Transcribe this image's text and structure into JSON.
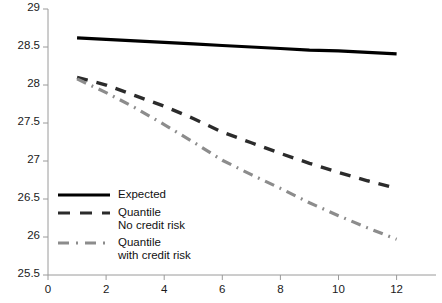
{
  "chart_data": {
    "type": "line",
    "title": "",
    "xlabel": "",
    "ylabel": "",
    "xlim": [
      0,
      12
    ],
    "ylim": [
      25.5,
      29
    ],
    "grid": false,
    "legend_position": "lower-left-inside",
    "x_ticks": [
      "0",
      "2",
      "4",
      "6",
      "8",
      "10",
      "12"
    ],
    "x_tick_values": [
      0,
      2,
      4,
      6,
      8,
      10,
      12
    ],
    "y_ticks": [
      "25.5",
      "26",
      "26.5",
      "27",
      "27.5",
      "28",
      "28.5",
      "29"
    ],
    "y_tick_values": [
      25.5,
      26,
      26.5,
      27,
      27.5,
      28,
      28.5,
      29
    ],
    "x": [
      1,
      2,
      3,
      4,
      5,
      6,
      7,
      8,
      9,
      10,
      11,
      12
    ],
    "series": [
      {
        "name": "Expected",
        "style": "solid",
        "color": "#000000",
        "values": [
          28.62,
          28.6,
          28.58,
          28.56,
          28.54,
          28.52,
          28.5,
          28.48,
          28.46,
          28.45,
          28.43,
          28.41
        ]
      },
      {
        "name": "Quantile\nNo credit risk",
        "style": "dashed",
        "color": "#2b2b2b",
        "values": [
          28.1,
          28.0,
          27.86,
          27.72,
          27.56,
          27.38,
          27.24,
          27.1,
          26.97,
          26.85,
          26.74,
          26.64
        ]
      },
      {
        "name": "Quantile\nwith credit risk",
        "style": "dash-dot",
        "color": "#8c8c8c",
        "values": [
          28.08,
          27.9,
          27.7,
          27.48,
          27.25,
          27.01,
          26.82,
          26.64,
          26.45,
          26.28,
          26.12,
          25.97
        ]
      }
    ]
  },
  "legend": {
    "items": [
      {
        "label": "Expected"
      },
      {
        "label": "Quantile\nNo credit risk"
      },
      {
        "label": "Quantile\nwith credit risk"
      }
    ]
  },
  "axes": {
    "y_axis_color": "#9a9a9a",
    "x_axis_color": "#9a9a9a"
  }
}
